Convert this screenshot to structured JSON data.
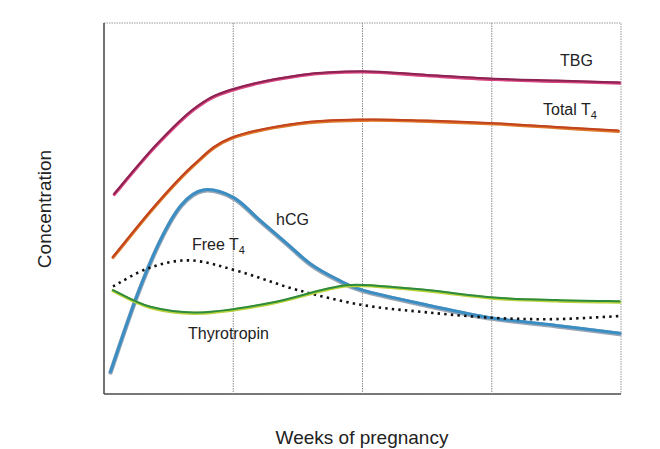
{
  "chart_data": {
    "type": "line",
    "title": "",
    "xlabel": "Weeks of pregnancy",
    "ylabel": "Concentration",
    "xlim": [
      0,
      40
    ],
    "ylim": [
      0,
      100
    ],
    "x_gridlines": [
      10,
      20,
      30
    ],
    "y_gridlines": [],
    "x_tick_labels": [],
    "y_tick_labels": [],
    "legend": "inline labels",
    "series": [
      {
        "name": "TBG",
        "label": "TBG",
        "color": "#8a2252",
        "style": "solid",
        "x": [
          0.8,
          4,
          7,
          9.8,
          15.2,
          20,
          25,
          30.2,
          35,
          39.9
        ],
        "values": [
          54,
          67,
          77,
          82,
          86,
          87,
          86,
          85,
          84.5,
          84
        ]
      },
      {
        "name": "Total T4",
        "label": "Total T",
        "label_sub": "4",
        "color": "#c0431e",
        "style": "solid",
        "x": [
          0.7,
          4,
          7,
          9.8,
          15,
          20,
          25,
          30.2,
          35,
          39.8
        ],
        "values": [
          37,
          51,
          62,
          69,
          73,
          74,
          73.7,
          73,
          72,
          71
        ]
      },
      {
        "name": "hCG",
        "label": "hCG",
        "color": "#3a8ec4",
        "style": "solid",
        "x": [
          0.5,
          2.5,
          4.3,
          6,
          7.7,
          10,
          12,
          14,
          16,
          18,
          20,
          25,
          30,
          35,
          39.9
        ],
        "values": [
          6,
          26,
          41,
          51,
          55,
          53,
          47,
          41,
          35,
          31,
          28,
          24,
          20.5,
          18.5,
          16.4
        ]
      },
      {
        "name": "Free T4",
        "label": "Free T",
        "label_sub": "4",
        "color": "#111111",
        "style": "dotted",
        "x": [
          0.7,
          3.5,
          6.7,
          10.5,
          15,
          20,
          25,
          30.2,
          35,
          39.9
        ],
        "values": [
          29,
          34,
          36,
          33,
          28,
          24,
          22,
          20.5,
          20.2,
          21
        ]
      },
      {
        "name": "Thyrotropin",
        "label": "Thyrotropin",
        "color": "#2e8b3e",
        "style": "solid",
        "x": [
          0.7,
          3.6,
          7.4,
          12.8,
          17.4,
          20,
          25,
          30.2,
          35,
          39.9
        ],
        "values": [
          28,
          23.5,
          22,
          24.5,
          28.5,
          29.4,
          28,
          26,
          25.3,
          25
        ]
      }
    ]
  }
}
